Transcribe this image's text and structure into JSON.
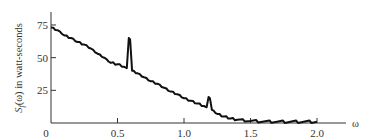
{
  "chart_data": {
    "type": "line",
    "title": "",
    "xlabel": "ω",
    "ylabel": "Sf(ω) in watt-seconds",
    "xlim": [
      0,
      2.2
    ],
    "ylim": [
      0,
      85
    ],
    "grid": false,
    "legend": null,
    "x_ticks": [
      0,
      0.5,
      1.0,
      1.5,
      2.0
    ],
    "x_tick_labels": [
      "0",
      "0.5",
      "1.0",
      "1.5",
      "2.0"
    ],
    "y_ticks": [
      25,
      50,
      75
    ],
    "y_tick_labels": [
      "25",
      "50",
      "75"
    ],
    "series": [
      {
        "name": "Sf(ω)",
        "color": "#111111",
        "x": [
          0,
          0.05,
          0.1,
          0.15,
          0.2,
          0.25,
          0.3,
          0.35,
          0.4,
          0.45,
          0.5,
          0.55,
          0.57,
          0.585,
          0.595,
          0.61,
          0.65,
          0.7,
          0.75,
          0.8,
          0.85,
          0.9,
          0.95,
          1.0,
          1.05,
          1.1,
          1.15,
          1.17,
          1.185,
          1.195,
          1.21,
          1.25,
          1.3,
          1.35,
          1.4,
          1.5,
          1.6,
          1.7,
          1.8,
          1.9,
          2.0
        ],
        "values": [
          73,
          71,
          67,
          65,
          62,
          60,
          57,
          53,
          50,
          46,
          45,
          43,
          42,
          65,
          64,
          40,
          38,
          35,
          32,
          30,
          27,
          24,
          22,
          19,
          17,
          15,
          13,
          12,
          20,
          19,
          10,
          7,
          5,
          3.5,
          2.5,
          1.5,
          1.2,
          1,
          1,
          1,
          1
        ]
      }
    ],
    "annotations": [
      "Peak near ω≈0.59",
      "Peak near ω≈1.19"
    ]
  }
}
